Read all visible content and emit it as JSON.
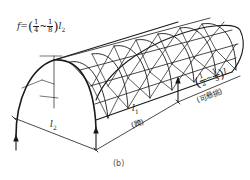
{
  "diagram": {
    "type": "structural-sketch",
    "labels": {
      "rise_formula": {
        "prefix": "f=",
        "frac1_num": "1",
        "frac1_den": "4",
        "separator": "~",
        "frac2_num": "1",
        "frac2_den": "8",
        "suffix": "l",
        "suffix_sub": "2"
      },
      "width": {
        "text": "l",
        "sub": "2"
      },
      "span": {
        "text": "l",
        "sub": "1",
        "note": "(跨)"
      },
      "cantilever": {
        "frac1_num": "1",
        "frac1_den": "2",
        "separator": "~",
        "frac2_num": "1",
        "frac2_den": "3",
        "suffix": "l",
        "note": "(可悬挑)"
      },
      "caption": "(b)"
    },
    "colors": {
      "line": "#1a1a1a",
      "background": "#ffffff"
    }
  }
}
